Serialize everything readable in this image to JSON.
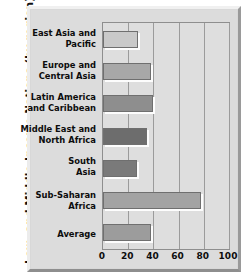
{
  "chart_data": {
    "type": "bar",
    "orientation": "horizontal",
    "title": "",
    "xlabel": "",
    "ylabel": "Low- and Middle-Income Nations  (by region)",
    "xlim": [
      0,
      100
    ],
    "xticks": [
      0,
      20,
      40,
      60,
      80,
      100
    ],
    "xtick_labels": [
      "0",
      "20",
      "40",
      "60",
      "80",
      "100"
    ],
    "grid": "vertical",
    "legend": "none",
    "categories": [
      "East Asia and Pacific",
      "Europe and Central Asia",
      "Latin America and Caribbean",
      "Middle East and North Africa",
      "South Asia",
      "Sub-Saharan Africa",
      "Average"
    ],
    "category_lines": [
      [
        "East Asia and",
        "Pacific"
      ],
      [
        "Europe and",
        "Central Asia"
      ],
      [
        "Latin America",
        "and Caribbean"
      ],
      [
        "Middle East and",
        "North Africa"
      ],
      [
        "South",
        "Asia"
      ],
      [
        "Sub-Saharan",
        "Africa"
      ],
      [
        "Average"
      ]
    ],
    "values": [
      28,
      38,
      40,
      35,
      27,
      78,
      38
    ],
    "bar_colors": [
      "#c9c9c9",
      "#a8a8a8",
      "#8e8e8e",
      "#6d6d6d",
      "#7a7a7a",
      "#a3a3a3",
      "#9c9c9c"
    ],
    "colors": {
      "plot_background": "#dedede",
      "panel_background": "#dcdcdc",
      "frame": "#d8d8d8",
      "gridline": "#9b9b9b",
      "bar_outline": "#6f6f6f",
      "bar_highlight": "#fdfdfd",
      "text": "#0d0d0d"
    }
  }
}
